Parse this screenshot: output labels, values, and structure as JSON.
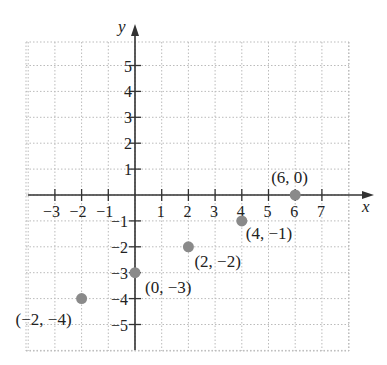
{
  "chart_data": {
    "type": "scatter",
    "title": "",
    "xlabel": "x",
    "ylabel": "y",
    "xlim": [
      -4,
      8
    ],
    "ylim": [
      -6,
      6
    ],
    "grid": true,
    "x_ticks": [
      -3,
      -2,
      -1,
      1,
      2,
      3,
      4,
      5,
      6,
      7
    ],
    "y_ticks": [
      -5,
      -4,
      -3,
      -2,
      -1,
      1,
      2,
      3,
      4,
      5
    ],
    "x_tick_labels": [
      "−3",
      "−2",
      "−1",
      "1",
      "2",
      "3",
      "4",
      "5",
      "6",
      "7"
    ],
    "y_tick_labels": [
      "−5",
      "−4",
      "−3",
      "−2",
      "−1",
      "1",
      "2",
      "3",
      "4",
      "5"
    ],
    "points": [
      {
        "x": -2,
        "y": -4,
        "label": "(−2, −4)"
      },
      {
        "x": 0,
        "y": -3,
        "label": "(0, −3)"
      },
      {
        "x": 2,
        "y": -2,
        "label": "(2, −2)"
      },
      {
        "x": 4,
        "y": -1,
        "label": "(4, −1)"
      },
      {
        "x": 6,
        "y": 0,
        "label": "(6, 0)"
      }
    ],
    "point_color": "#8a8a8a"
  }
}
